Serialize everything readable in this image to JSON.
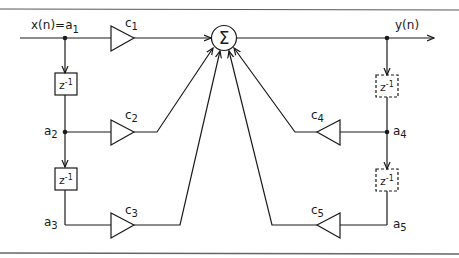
{
  "diagram": {
    "type": "signal-flow / IIR filter structure",
    "input_label": "x(n)=a",
    "input_sub": "1",
    "output_label": "y(n)",
    "sum_symbol": "Σ",
    "delay_label": "z",
    "delay_exp": "-1",
    "feedforward": {
      "taps": [
        {
          "node": "a",
          "node_sub": "1",
          "coef": "c",
          "coef_sub": "1"
        },
        {
          "node": "a",
          "node_sub": "2",
          "coef": "c",
          "coef_sub": "2"
        },
        {
          "node": "a",
          "node_sub": "3",
          "coef": "c",
          "coef_sub": "3"
        }
      ],
      "delay_style": "solid"
    },
    "feedback": {
      "taps": [
        {
          "node": "a",
          "node_sub": "4",
          "coef": "c",
          "coef_sub": "4"
        },
        {
          "node": "a",
          "node_sub": "5",
          "coef": "c",
          "coef_sub": "5"
        }
      ],
      "delay_style": "dashed"
    },
    "colors": {
      "stroke": "#1a1a1a",
      "border": "#666666",
      "background": "#ffffff"
    }
  }
}
